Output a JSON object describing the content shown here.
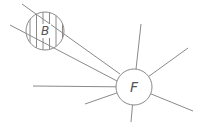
{
  "diagram": {
    "colors": {
      "stroke": "#8a8a8a",
      "label": "#555555",
      "background": "#ffffff"
    },
    "nodes": [
      {
        "id": "B",
        "label": "B",
        "cx": 45,
        "cy": 31,
        "r": 19,
        "fill": "hatched"
      },
      {
        "id": "F",
        "label": "F",
        "cx": 134,
        "cy": 87,
        "r": 18,
        "fill": "none"
      }
    ],
    "rays_from_F": [
      {
        "x2": 141,
        "y2": 24
      },
      {
        "x2": 188,
        "y2": 48
      },
      {
        "x2": 193,
        "y2": 111
      },
      {
        "x2": 131,
        "y2": 122
      },
      {
        "x2": 85,
        "y2": 104
      },
      {
        "x2": 33,
        "y2": 86
      }
    ],
    "lines_through_B": [
      {
        "x1": 22,
        "y1": 4,
        "x2": 120,
        "y2": 74
      },
      {
        "x1": 10,
        "y1": 25,
        "x2": 117,
        "y2": 81
      }
    ]
  }
}
